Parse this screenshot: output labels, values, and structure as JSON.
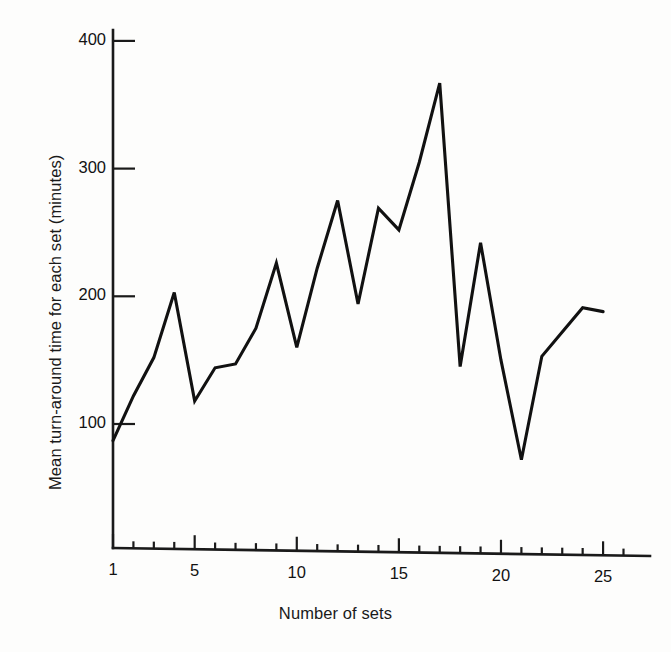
{
  "figure": {
    "background_color": "#fdfdfc",
    "line_color": "#111111",
    "axis_color": "#1a1a1a"
  },
  "chart_data": {
    "type": "line",
    "title": "",
    "xlabel": "Number of sets",
    "ylabel": "Mean turn-around time for each set (minutes)",
    "x": [
      1,
      2,
      3,
      4,
      5,
      6,
      7,
      8,
      9,
      10,
      11,
      12,
      13,
      14,
      15,
      16,
      17,
      18,
      19,
      20,
      21,
      22,
      23,
      24,
      25
    ],
    "values": [
      87,
      122,
      152,
      203,
      118,
      144,
      147,
      175,
      226,
      160,
      222,
      275,
      194,
      269,
      252,
      305,
      367,
      145,
      242,
      150,
      72,
      153,
      172,
      191,
      188
    ],
    "series": [
      {
        "name": "Mean turn-around time",
        "values": [
          87,
          122,
          152,
          203,
          118,
          144,
          147,
          175,
          226,
          160,
          222,
          275,
          194,
          269,
          252,
          305,
          367,
          145,
          242,
          150,
          72,
          153,
          172,
          191,
          188
        ]
      }
    ],
    "xlim": [
      1,
      26
    ],
    "ylim": [
      0,
      415
    ],
    "xticks_major": [
      1,
      5,
      10,
      15,
      20,
      25
    ],
    "xticks_major_labels": [
      "1",
      "5",
      "10",
      "15",
      "20",
      "25"
    ],
    "xticks_minor": [
      2,
      3,
      4,
      6,
      7,
      8,
      9,
      11,
      12,
      13,
      14,
      16,
      17,
      18,
      19,
      21,
      22,
      23,
      24,
      26
    ],
    "yticks": [
      100,
      200,
      300,
      400
    ],
    "ytick_labels": [
      "100",
      "200",
      "300",
      "400"
    ],
    "grid": false,
    "legend": false,
    "legend_position": "none",
    "markers": false
  }
}
